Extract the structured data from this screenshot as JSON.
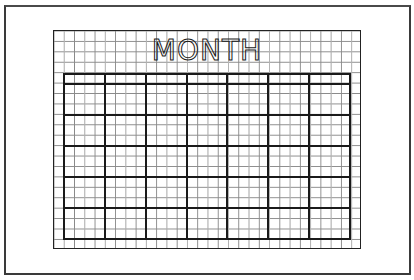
{
  "page": {
    "title": "MONTH",
    "border_color": "#3a3a3a",
    "grid_line_color": "#8a8a8a",
    "calendar_line_color": "#1a1a1a"
  },
  "grid": {
    "columns": 30,
    "rows": 21
  },
  "calendar": {
    "header_cells": [
      "",
      "",
      "",
      "",
      "",
      "",
      ""
    ],
    "weeks": [
      [
        "",
        "",
        "",
        "",
        "",
        "",
        ""
      ],
      [
        "",
        "",
        "",
        "",
        "",
        "",
        ""
      ],
      [
        "",
        "",
        "",
        "",
        "",
        "",
        ""
      ],
      [
        "",
        "",
        "",
        "",
        "",
        "",
        ""
      ],
      [
        "",
        "",
        "",
        "",
        "",
        "",
        ""
      ]
    ]
  }
}
